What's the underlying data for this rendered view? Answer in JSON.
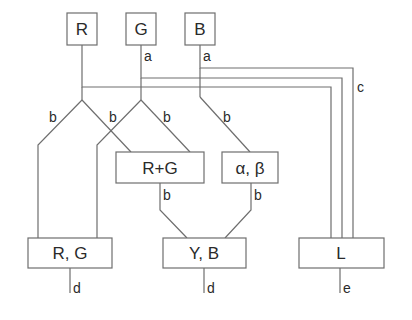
{
  "diagram": {
    "inputs": [
      {
        "id": "R",
        "label": "R"
      },
      {
        "id": "G",
        "label": "G"
      },
      {
        "id": "B",
        "label": "B"
      }
    ],
    "middle": [
      {
        "id": "RG_sum",
        "label": "R+G"
      },
      {
        "id": "alpha_beta",
        "label": "α, β"
      }
    ],
    "outputs": [
      {
        "id": "RG",
        "label": "R, G"
      },
      {
        "id": "YB",
        "label": "Y, B"
      },
      {
        "id": "L",
        "label": "L"
      }
    ],
    "edge_labels": {
      "g_a": "a",
      "b_a": "a",
      "r_left_b": "b",
      "r_right_b": "b",
      "g_right_b": "b",
      "b_down_b": "b",
      "rg_sum_b": "b",
      "alpha_beta_b": "b",
      "l_bundle_c": "c",
      "rg_out_d": "d",
      "yb_out_d": "d",
      "l_out_e": "e"
    },
    "colors": {
      "line": "#6e6e6e",
      "text": "#2a2a2a",
      "background": "#ffffff"
    }
  }
}
